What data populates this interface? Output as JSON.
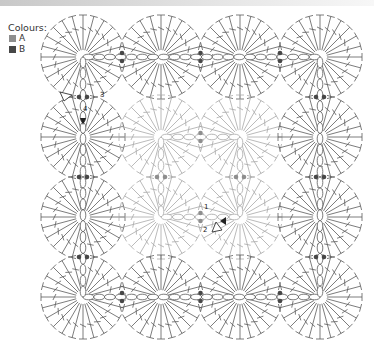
{
  "legend": {
    "title": "Colours:",
    "items": [
      {
        "label": "A",
        "color": "#8e8e8e"
      },
      {
        "label": "B",
        "color": "#474747"
      }
    ]
  },
  "diagram": {
    "grid": {
      "cols": 4,
      "rows": 4,
      "x": [
        83,
        161,
        240,
        320
      ],
      "y": [
        57,
        137,
        217,
        297
      ],
      "radius": 42,
      "spokes": 24
    },
    "colors": {
      "outer_stroke": "#5a5a5a",
      "inner_stroke": "#a8a8a8",
      "dot_outer": "#474747",
      "dot_inner": "#8e8e8e"
    },
    "inner_motifs": [
      [
        1,
        1
      ],
      [
        2,
        1
      ],
      [
        1,
        2
      ],
      [
        2,
        2
      ]
    ],
    "labels": [
      {
        "text": "3",
        "x": 100,
        "y": 97
      },
      {
        "text": "4",
        "x": 83,
        "y": 111
      },
      {
        "text": "1",
        "x": 204,
        "y": 209
      },
      {
        "text": "2",
        "x": 203,
        "y": 232
      }
    ]
  }
}
